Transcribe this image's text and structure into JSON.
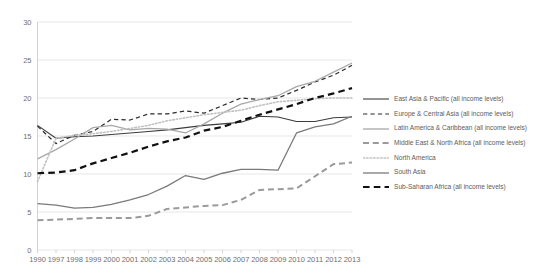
{
  "chart_data": {
    "type": "line",
    "title": "",
    "xlabel": "",
    "ylabel": "",
    "ylim": [
      0,
      30
    ],
    "yticks": [
      0,
      5,
      10,
      15,
      20,
      25,
      30
    ],
    "grid": true,
    "legend_position": "right",
    "categories": [
      "1990",
      "1997",
      "1998",
      "1999",
      "2000",
      "2001",
      "2002",
      "2003",
      "2004",
      "2005",
      "2006",
      "2007",
      "2008",
      "2009",
      "2010",
      "2011",
      "2012",
      "2013"
    ],
    "series": [
      {
        "name": "East Asia & Pacific (all income levels)",
        "style": "solid",
        "color": "#3d3d3d",
        "width": 1.1,
        "values": [
          16.4,
          14.7,
          14.9,
          15.0,
          15.2,
          15.4,
          15.6,
          15.8,
          16.1,
          16.4,
          16.6,
          16.8,
          17.6,
          17.5,
          16.9,
          16.9,
          17.4,
          17.5
        ]
      },
      {
        "name": "Europe & Central Asia (all income levels)",
        "style": "dashed",
        "color": "#2b2b2b",
        "width": 1.2,
        "values": [
          16.3,
          14.0,
          15.1,
          15.6,
          17.2,
          17.1,
          17.9,
          17.9,
          18.3,
          18.0,
          19.0,
          20.0,
          19.8,
          20.0,
          21.0,
          22.1,
          23.0,
          24.3
        ]
      },
      {
        "name": "Latin America & Caribbean (all income levels)",
        "style": "solid",
        "color": "#a8a8a8",
        "width": 1.3,
        "values": [
          12.0,
          13.2,
          14.6,
          16.1,
          16.4,
          15.8,
          16.0,
          15.9,
          15.4,
          16.6,
          18.0,
          19.2,
          19.8,
          20.3,
          21.5,
          22.2,
          23.4,
          24.6
        ]
      },
      {
        "name": "Middle East & North Africa (all income levels)",
        "style": "thick-dashed",
        "color": "#9a9a9a",
        "width": 2.0,
        "values": [
          3.9,
          4.0,
          4.1,
          4.2,
          4.2,
          4.2,
          4.5,
          5.4,
          5.6,
          5.8,
          5.9,
          6.6,
          7.9,
          8.0,
          8.1,
          9.7,
          11.3,
          11.5
        ]
      },
      {
        "name": "North America",
        "style": "dotted",
        "color": "#c2c2c2",
        "width": 1.6,
        "values": [
          9.0,
          14.7,
          15.1,
          15.3,
          15.6,
          16.0,
          16.4,
          17.0,
          17.4,
          17.8,
          18.1,
          18.4,
          19.0,
          19.5,
          19.7,
          19.9,
          20.0,
          20.0
        ]
      },
      {
        "name": "South Asia",
        "style": "solid",
        "color": "#7a7a7a",
        "width": 1.3,
        "values": [
          6.1,
          5.9,
          5.5,
          5.6,
          6.0,
          6.6,
          7.3,
          8.4,
          9.8,
          9.3,
          10.1,
          10.6,
          10.6,
          10.5,
          15.4,
          16.2,
          16.6,
          17.6
        ]
      },
      {
        "name": "Sub-Saharan Africa (all income levels)",
        "style": "thick-dashed",
        "color": "#111111",
        "width": 2.2,
        "values": [
          10.1,
          10.2,
          10.5,
          11.4,
          12.1,
          12.8,
          13.6,
          14.3,
          14.8,
          15.7,
          16.2,
          17.0,
          17.8,
          18.5,
          19.2,
          20.0,
          20.6,
          21.3
        ]
      }
    ]
  }
}
